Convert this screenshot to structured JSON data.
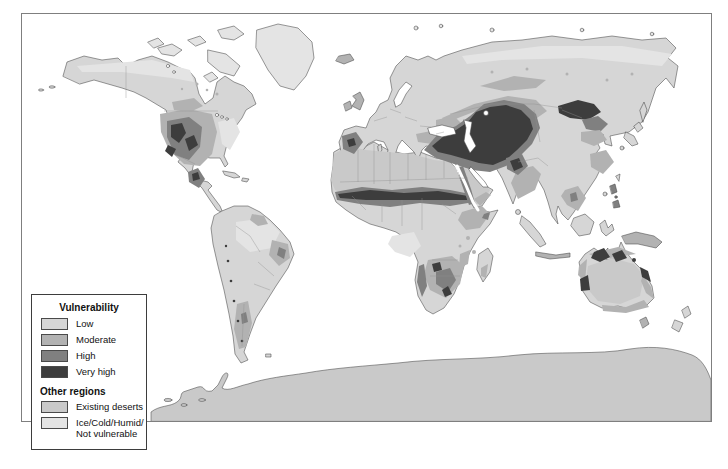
{
  "legend": {
    "title": "Vulnerability",
    "classes": [
      {
        "label": "Low",
        "color": "#d6d6d6"
      },
      {
        "label": "Moderate",
        "color": "#b2b2b2"
      },
      {
        "label": "High",
        "color": "#808080"
      },
      {
        "label": "Very high",
        "color": "#3d3d3d"
      }
    ],
    "other_title": "Other regions",
    "other_classes": [
      {
        "label": "Existing deserts",
        "color": "#c9c9c9"
      },
      {
        "label": "Ice/Cold/Humid/\nNot vulnerable",
        "color": "#e4e4e4"
      }
    ]
  },
  "colors": {
    "low": "#d6d6d6",
    "moderate": "#b2b2b2",
    "high": "#808080",
    "very_high": "#3d3d3d",
    "existing_deserts": "#c9c9c9",
    "not_vulnerable": "#e4e4e4",
    "ice": "#dedede",
    "ocean": "#ffffff",
    "coastline": "#454545",
    "country_border": "#8f8f8f",
    "frame": "#7f7f7f"
  }
}
